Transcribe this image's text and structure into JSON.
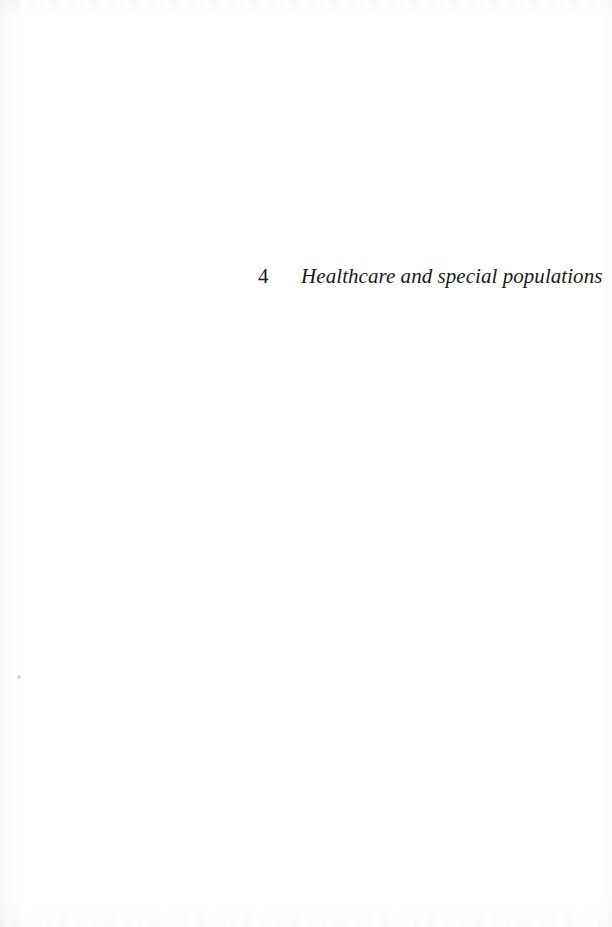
{
  "page": {
    "background_color": "#ffffff",
    "ink_color": "#1a1a1a",
    "width": 612,
    "height": 927
  },
  "heading": {
    "number": "4",
    "title": "Healthcare and special populations"
  },
  "artifacts": {
    "speck_label": "",
    "noise_top_label": "",
    "noise_bottom_label": ""
  }
}
